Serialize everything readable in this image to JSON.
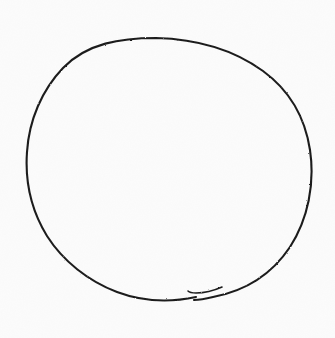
{
  "document": {
    "kind": "scanned-sketch",
    "title": "Hand-drawn circle",
    "width": 335,
    "height": 338,
    "background_color": "#fcfcfc",
    "has_text": false,
    "text_content": "",
    "paper_texture": "faint-scanner-grain"
  },
  "drawing": {
    "name": "hand-drawn-circle",
    "description": "A single freehand closed circle drawn in dark ink, slightly irregular, with the stroke overshooting past its starting point at the bottom and finishing in a small upward hook.",
    "stroke_color": "#1e1e1e",
    "stroke_width": 2.1,
    "stroke_style": "freehand-ink",
    "closed": true,
    "shape": {
      "type": "ellipse",
      "center_x": 168,
      "center_y": 171,
      "radius_x": 143,
      "radius_y": 133,
      "bounds": {
        "left": 25,
        "top": 38,
        "right": 311,
        "bottom": 305
      }
    },
    "stroke_start": {
      "x": 196,
      "y": 297
    },
    "stroke_end": {
      "x": 188,
      "y": 291
    },
    "overshoot_tail": {
      "name": "stroke-end-hook",
      "description": "Short curved tail where the pen passed its start point and lifted upward",
      "tip_x": 188,
      "tip_y": 291,
      "length": 34
    },
    "main_path": "M 196 297 C 168 303 141 301 117 292 C 88 281 63 261 47 236 C 31 210 25 180 27 152 C 29 120 42 90 63 68 C 87 43 121 38 156 38 C 196 39 234 50 263 71 C 289 90 305 117 310 150 C 315 184 308 219 290 247 C 272 274 245 291 213 297 C 205 299 199 300 194 300",
    "tail_path": "M 222 287 C 213 291 204 293 196 293 C 192 293 189 292 188 291"
  }
}
